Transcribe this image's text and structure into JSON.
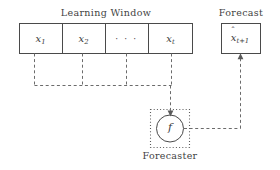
{
  "figure": {
    "width": 280,
    "height": 170,
    "background": "#ffffff",
    "stroke_color": "#4a4a4a",
    "dash_color": "#6b6b6b",
    "text_color": "#3f3f3f"
  },
  "learning_window": {
    "title": "Learning Window",
    "cells": [
      {
        "name": "cell-x1",
        "text": "x",
        "subscript": "1"
      },
      {
        "name": "cell-x2",
        "text": "x",
        "subscript": "2"
      },
      {
        "name": "cell-ellipsis",
        "text": "· · ·",
        "subscript": ""
      },
      {
        "name": "cell-xt",
        "text": "x",
        "subscript": "t"
      }
    ]
  },
  "forecaster": {
    "caption": "Forecaster",
    "function_symbol": "f"
  },
  "forecast": {
    "title": "Forecast",
    "value_base": "x",
    "value_hat": "ˆ",
    "value_subscript": "t+1"
  },
  "connections": [
    {
      "name": "x1-to-bus",
      "from": "cell-x1",
      "to": "bus"
    },
    {
      "name": "x2-to-bus",
      "from": "cell-x2",
      "to": "bus"
    },
    {
      "name": "ellipsis-to-bus",
      "from": "cell-ellipsis",
      "to": "bus"
    },
    {
      "name": "xt-to-bus",
      "from": "cell-xt",
      "to": "bus"
    },
    {
      "name": "bus-to-forecaster",
      "from": "bus",
      "to": "forecaster"
    },
    {
      "name": "forecaster-to-forecast",
      "from": "forecaster",
      "to": "forecast"
    }
  ]
}
